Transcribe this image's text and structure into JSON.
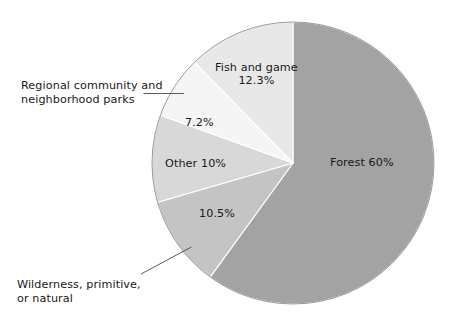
{
  "chart_data": {
    "type": "pie",
    "title": "",
    "subtitle": "",
    "xlabel": "",
    "ylabel": "",
    "legend_position": "none",
    "grid": false,
    "units": "percent",
    "start_angle_deg": 0,
    "direction": "clockwise",
    "categories": [
      "Forest",
      "Wilderness, primitive, or natural",
      "Other",
      "Regional community and neighborhood parks",
      "Fish and game"
    ],
    "values": [
      60,
      10.5,
      10,
      7.2,
      12.3
    ],
    "colors": [
      "#a3a3a3",
      "#c4c4c4",
      "#d8d8d8",
      "#f5f5f5",
      "#e8e8e8"
    ],
    "slices": [
      {
        "name": "Forest",
        "value": 60,
        "value_text": "60%",
        "label_text": "Forest 60%",
        "color": "#a3a3a3",
        "label_placement": "inside",
        "start_deg": 0,
        "end_deg": 216
      },
      {
        "name": "Wilderness, primitive, or natural",
        "value": 10.5,
        "value_text": "10.5%",
        "label_text": "10.5%",
        "callout_line1": "Wilderness, primitive,",
        "callout_line2": "or natural",
        "color": "#c4c4c4",
        "label_placement": "inside-with-callout",
        "start_deg": 216,
        "end_deg": 253.8
      },
      {
        "name": "Other",
        "value": 10,
        "value_text": "10%",
        "label_text": "Other 10%",
        "color": "#d8d8d8",
        "label_placement": "inside",
        "start_deg": 253.8,
        "end_deg": 289.8
      },
      {
        "name": "Regional community and neighborhood parks",
        "value": 7.2,
        "value_text": "7.2%",
        "label_text": "7.2%",
        "callout_line1": "Regional community and",
        "callout_line2": "neighborhood parks",
        "color": "#f5f5f5",
        "label_placement": "inside-with-callout",
        "start_deg": 289.8,
        "end_deg": 315.72
      },
      {
        "name": "Fish and game",
        "value": 12.3,
        "value_text": "12.3%",
        "label_line1": "Fish and game",
        "label_line2": "12.3%",
        "color": "#e8e8e8",
        "label_placement": "inside",
        "start_deg": 315.72,
        "end_deg": 360
      }
    ]
  },
  "geometry": {
    "center_x": 293,
    "center_y": 163,
    "radius": 141
  },
  "labels": {
    "forest": "Forest 60%",
    "fish_and_game_line1": "Fish and game",
    "fish_and_game_line2": "12.3%",
    "regional_pct": "7.2%",
    "other": "Other 10%",
    "wilderness_pct": "10.5%",
    "regional_callout_line1": "Regional community and",
    "regional_callout_line2": "neighborhood parks",
    "wilderness_callout_line1": "Wilderness, primitive,",
    "wilderness_callout_line2": "or natural"
  },
  "style": {
    "background": "#ffffff",
    "text_color": "#18181a",
    "leader_color": "#4a4a4a",
    "outline_color": "#8f8f8f",
    "slice_border": "#ffffff"
  }
}
